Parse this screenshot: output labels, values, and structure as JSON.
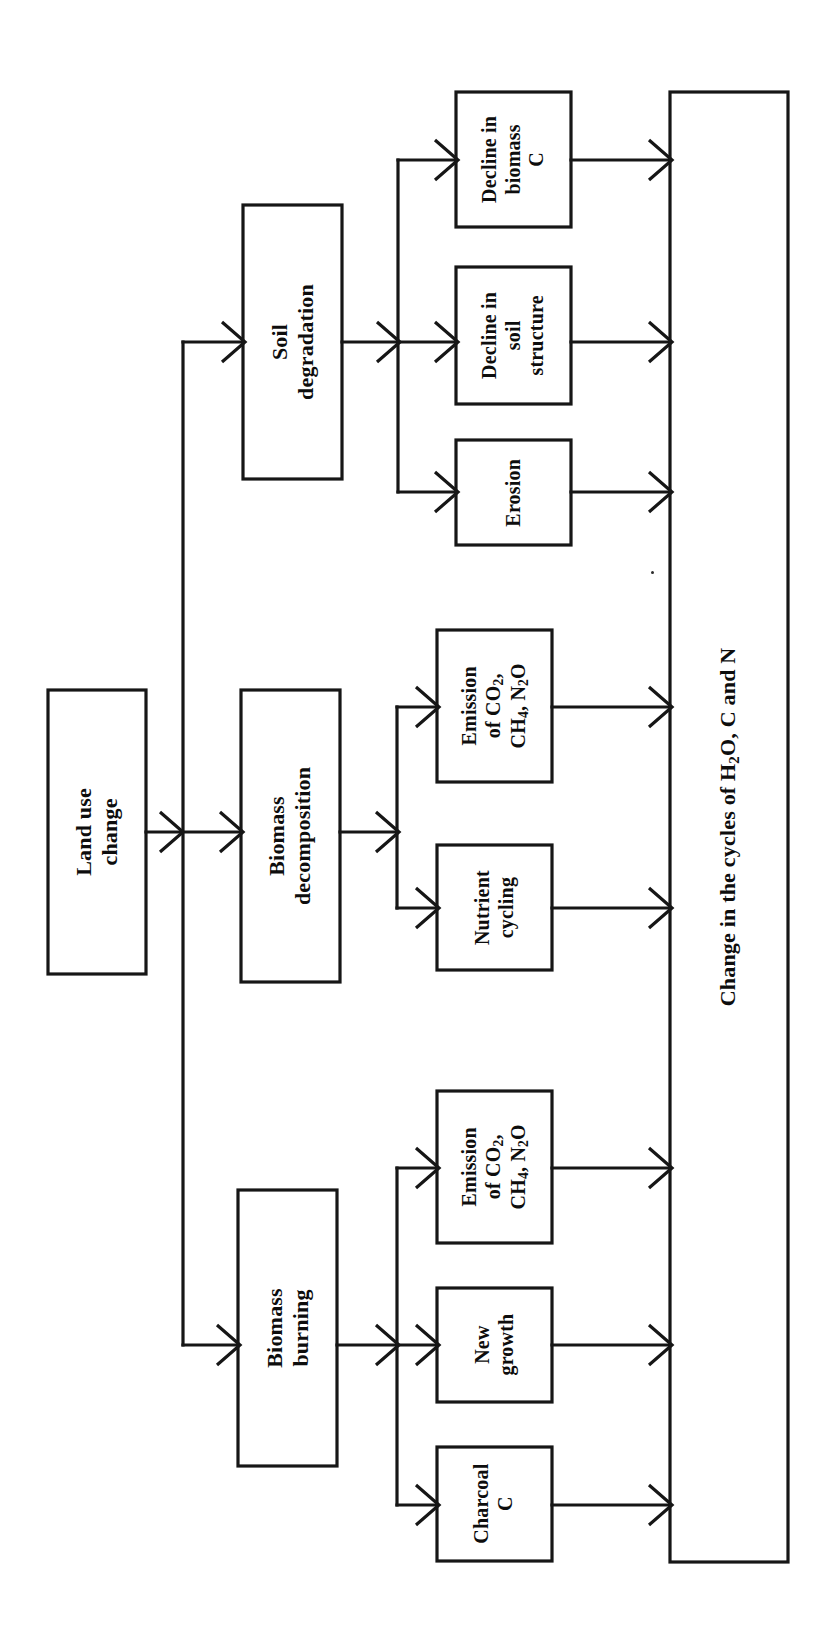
{
  "diagram": {
    "type": "flowchart",
    "orientation": "rotated-90-ccw",
    "title_node": "Change in the cycles of H2O, C and N",
    "root": {
      "id": "land-use-change",
      "label": "Land use change"
    },
    "processes": [
      {
        "id": "soil-degradation",
        "label": "Soil\ndegradation"
      },
      {
        "id": "biomass-decomposition",
        "label": "Biomass\ndecomposition"
      },
      {
        "id": "biomass-burning",
        "label": "Biomass\nburning"
      }
    ],
    "outcomes": [
      {
        "id": "decline-in-biomass-c",
        "label": "Decline in\nbiomass\nC",
        "parent": "soil-degradation"
      },
      {
        "id": "decline-in-soil-structure",
        "label": "Decline in\nsoil\nstructure",
        "parent": "soil-degradation"
      },
      {
        "id": "erosion",
        "label": "Erosion",
        "parent": "soil-degradation"
      },
      {
        "id": "emission-decomposition",
        "label": "Emission\nof CO2,\nCH4, N2O",
        "parent": "biomass-decomposition"
      },
      {
        "id": "nutrient-cycling",
        "label": "Nutrient\ncycling",
        "parent": "biomass-decomposition"
      },
      {
        "id": "emission-burning",
        "label": "Emission\nof CO2,\nCH4, N2O",
        "parent": "biomass-burning"
      },
      {
        "id": "new-growth",
        "label": "New\ngrowth",
        "parent": "biomass-burning"
      },
      {
        "id": "charcoal-c",
        "label": "Charcoal\nC",
        "parent": "biomass-burning"
      }
    ],
    "sink": {
      "id": "change-in-cycles",
      "label": "Change in the cycles of H2O, C and N"
    },
    "colors": {
      "stroke": "#161616",
      "fill": "#ffffff",
      "text": "#0d0d0d",
      "background": "#ffffff"
    }
  }
}
